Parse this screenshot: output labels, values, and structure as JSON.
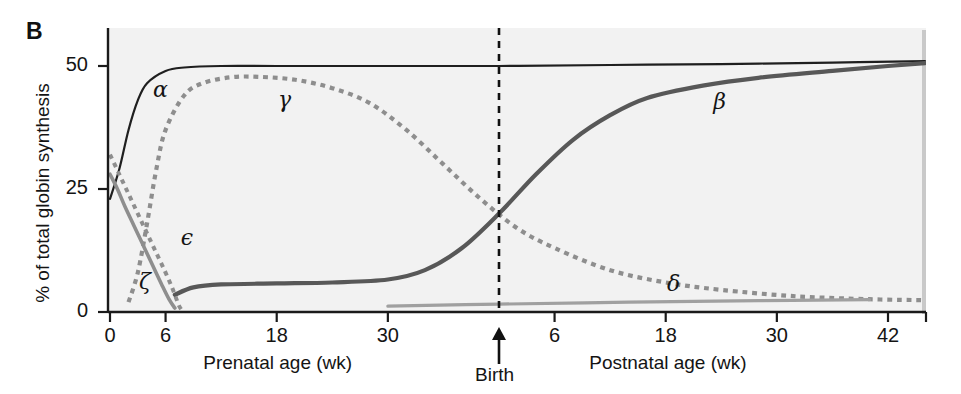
{
  "figure": {
    "panel_label": "B",
    "background_color": "#f2f2f2",
    "axis_color": "#1a1a1a"
  },
  "chart_data": {
    "type": "line",
    "title": "",
    "subtitle": "",
    "panel": "B",
    "ylabel": "% of total globin synthesis",
    "ylim": [
      0,
      53
    ],
    "yticks": [
      0,
      25,
      50
    ],
    "ytick_labels": [
      "0",
      "25",
      "50"
    ],
    "grid": false,
    "legend_position": "inline-curve-labels",
    "xlabel_left": "Prenatal age (wk)",
    "xlabel_right": "Postnatal age (wk)",
    "xticks_prenatal": [
      0,
      6,
      18,
      30
    ],
    "xtick_labels_prenatal": [
      "0",
      "6",
      "18",
      "30"
    ],
    "xticks_postnatal": [
      6,
      18,
      30,
      42
    ],
    "xtick_labels_postnatal": [
      "6",
      "18",
      "30",
      "42"
    ],
    "annotations": [
      {
        "text": "Birth",
        "type": "arrow-marker",
        "x_axis_position": "birth",
        "prenatal_week": 42
      }
    ],
    "birth_marker": {
      "label": "Birth",
      "dashed_line": true,
      "line_color": "#111111"
    },
    "series": [
      {
        "name": "alpha",
        "label": "α",
        "style": "solid",
        "color": "#1f1f1f",
        "width": 2.2,
        "points": [
          {
            "x": 0,
            "y": 23
          },
          {
            "x": 1,
            "y": 29
          },
          {
            "x": 2,
            "y": 37
          },
          {
            "x": 3,
            "y": 43
          },
          {
            "x": 4,
            "y": 46.5
          },
          {
            "x": 6,
            "y": 49
          },
          {
            "x": 8,
            "y": 49.7
          },
          {
            "x": 12,
            "y": 50
          },
          {
            "x": 18,
            "y": 50
          },
          {
            "x": 30,
            "y": 50
          },
          {
            "x": 42,
            "y": 50
          },
          {
            "x": 54,
            "y": 50.2
          },
          {
            "x": 66,
            "y": 50.4
          },
          {
            "x": 78,
            "y": 50.7
          },
          {
            "x": 88,
            "y": 51
          }
        ]
      },
      {
        "name": "gamma",
        "label": "γ",
        "style": "dashed",
        "color": "#8e8e8e",
        "width": 4.2,
        "points": [
          {
            "x": 2,
            "y": 2
          },
          {
            "x": 3,
            "y": 8
          },
          {
            "x": 4,
            "y": 18
          },
          {
            "x": 5,
            "y": 29
          },
          {
            "x": 6,
            "y": 37
          },
          {
            "x": 8,
            "y": 44
          },
          {
            "x": 10,
            "y": 46.5
          },
          {
            "x": 13,
            "y": 47.7
          },
          {
            "x": 16,
            "y": 47.8
          },
          {
            "x": 20,
            "y": 47.2
          },
          {
            "x": 24,
            "y": 45.5
          },
          {
            "x": 28,
            "y": 42.5
          },
          {
            "x": 32,
            "y": 37
          },
          {
            "x": 36,
            "y": 30
          },
          {
            "x": 40,
            "y": 23
          },
          {
            "x": 44,
            "y": 17
          },
          {
            "x": 48,
            "y": 13
          },
          {
            "x": 54,
            "y": 8.5
          },
          {
            "x": 60,
            "y": 6
          },
          {
            "x": 66,
            "y": 4.5
          },
          {
            "x": 74,
            "y": 3.2
          },
          {
            "x": 82,
            "y": 2.6
          },
          {
            "x": 88,
            "y": 2.4
          }
        ]
      },
      {
        "name": "beta",
        "label": "β",
        "style": "solid",
        "color": "#585858",
        "width": 4.2,
        "points": [
          {
            "x": 7,
            "y": 3.5
          },
          {
            "x": 9,
            "y": 5
          },
          {
            "x": 12,
            "y": 5.6
          },
          {
            "x": 18,
            "y": 5.8
          },
          {
            "x": 24,
            "y": 6
          },
          {
            "x": 30,
            "y": 6.6
          },
          {
            "x": 34,
            "y": 8.5
          },
          {
            "x": 38,
            "y": 13
          },
          {
            "x": 42,
            "y": 20
          },
          {
            "x": 46,
            "y": 28
          },
          {
            "x": 50,
            "y": 35
          },
          {
            "x": 54,
            "y": 40
          },
          {
            "x": 58,
            "y": 43.5
          },
          {
            "x": 64,
            "y": 46
          },
          {
            "x": 70,
            "y": 47.6
          },
          {
            "x": 78,
            "y": 49
          },
          {
            "x": 84,
            "y": 50
          },
          {
            "x": 88,
            "y": 50.6
          }
        ]
      },
      {
        "name": "zeta",
        "label": "ζ",
        "style": "solid",
        "color": "#8e8e8e",
        "width": 3.6,
        "points": [
          {
            "x": 0,
            "y": 28
          },
          {
            "x": 0.8,
            "y": 25
          },
          {
            "x": 1.6,
            "y": 21.5
          },
          {
            "x": 2.6,
            "y": 17.5
          },
          {
            "x": 3.6,
            "y": 13.5
          },
          {
            "x": 4.6,
            "y": 9.5
          },
          {
            "x": 5.6,
            "y": 5.5
          },
          {
            "x": 6.4,
            "y": 2.5
          },
          {
            "x": 7.0,
            "y": 0.8
          }
        ]
      },
      {
        "name": "epsilon",
        "label": "ϵ",
        "style": "dashed",
        "color": "#8e8e8e",
        "width": 4.0,
        "points": [
          {
            "x": 0,
            "y": 32
          },
          {
            "x": 1,
            "y": 28
          },
          {
            "x": 2,
            "y": 24
          },
          {
            "x": 3,
            "y": 20
          },
          {
            "x": 4,
            "y": 16
          },
          {
            "x": 5,
            "y": 12
          },
          {
            "x": 6,
            "y": 8
          },
          {
            "x": 6.8,
            "y": 4.5
          },
          {
            "x": 7.4,
            "y": 1.5
          },
          {
            "x": 7.7,
            "y": 0.5
          }
        ]
      },
      {
        "name": "delta",
        "label": "δ",
        "style": "solid",
        "color": "#a0a0a0",
        "width": 3.2,
        "points": [
          {
            "x": 30,
            "y": 1.2
          },
          {
            "x": 42,
            "y": 1.6
          },
          {
            "x": 56,
            "y": 2.0
          },
          {
            "x": 70,
            "y": 2.3
          },
          {
            "x": 82,
            "y": 2.5
          }
        ]
      }
    ]
  }
}
